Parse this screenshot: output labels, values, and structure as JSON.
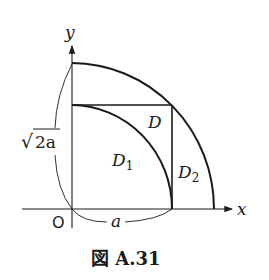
{
  "figure": {
    "caption": "図 A.31",
    "axes": {
      "x_label": "x",
      "y_label": "y",
      "origin_label": "O"
    },
    "regions": {
      "D": "D",
      "D1": "D",
      "D1_sub": "1",
      "D2": "D",
      "D2_sub": "2"
    },
    "dimensions": {
      "a_label": "a",
      "sqrt2a_label": "2a",
      "sqrt_symbol": "√"
    },
    "colors": {
      "stroke": "#1a1a1a",
      "background": "#ffffff"
    }
  }
}
